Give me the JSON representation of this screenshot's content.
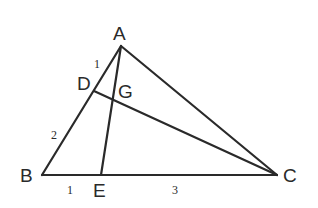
{
  "diagram": {
    "type": "triangle-cevians",
    "points": {
      "A": {
        "label": "A",
        "x": 121,
        "y": 46
      },
      "B": {
        "label": "B",
        "x": 42,
        "y": 175
      },
      "C": {
        "label": "C",
        "x": 277,
        "y": 175
      },
      "D": {
        "label": "D",
        "x": 94,
        "y": 91
      },
      "E": {
        "label": "E",
        "x": 101,
        "y": 175
      },
      "G": {
        "label": "G",
        "x": 113,
        "y": 100
      }
    },
    "segments": [
      {
        "from": "A",
        "to": "B"
      },
      {
        "from": "B",
        "to": "C"
      },
      {
        "from": "A",
        "to": "C"
      },
      {
        "from": "A",
        "to": "E"
      },
      {
        "from": "D",
        "to": "C"
      }
    ],
    "length_labels": {
      "AD": "1",
      "DB": "2",
      "BE": "1",
      "EC": "3"
    },
    "stroke_color": "#2a2a2a",
    "background": "#ffffff"
  }
}
